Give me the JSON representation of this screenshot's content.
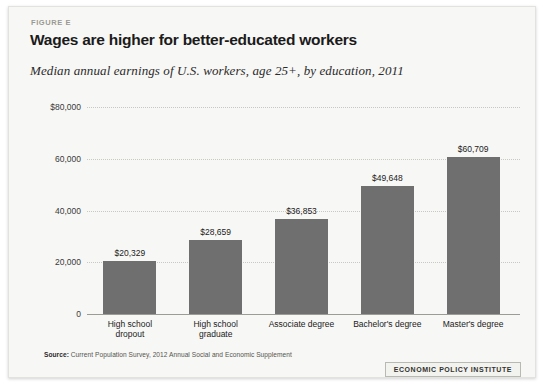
{
  "figure": {
    "label": "FIGURE E",
    "title": "Wages are higher for better-educated workers",
    "subtitle": "Median annual earnings of U.S. workers, age 25+, by education, 2011",
    "source_prefix": "Source:",
    "source_text": "Current Population Survey, 2012 Annual Social and Economic Supplement",
    "logo": "ECONOMIC POLICY INSTITUTE",
    "bar_color": "#6f6f6f",
    "background_color": "#f7f7f5"
  },
  "chart_data": {
    "type": "bar",
    "title": "Wages are higher for better-educated workers",
    "subtitle": "Median annual earnings of U.S. workers, age 25+, by education, 2011",
    "xlabel": "",
    "ylabel": "",
    "ylim": [
      0,
      80000
    ],
    "grid": true,
    "legend": "none",
    "ytick_labels": [
      "$80,000",
      "60,000",
      "40,000",
      "20,000",
      "0"
    ],
    "ytick_values": [
      80000,
      60000,
      40000,
      20000,
      0
    ],
    "categories": [
      "High school dropout",
      "High school graduate",
      "Associate degree",
      "Bachelor's degree",
      "Master's degree"
    ],
    "category_lines": [
      [
        "High school",
        "dropout"
      ],
      [
        "High school",
        "graduate"
      ],
      [
        "Associate degree"
      ],
      [
        "Bachelor's degree"
      ],
      [
        "Master's degree"
      ]
    ],
    "values": [
      20329,
      28659,
      36853,
      49648,
      60709
    ],
    "value_labels": [
      "$20,329",
      "$28,659",
      "$36,853",
      "$49,648",
      "$60,709"
    ]
  }
}
